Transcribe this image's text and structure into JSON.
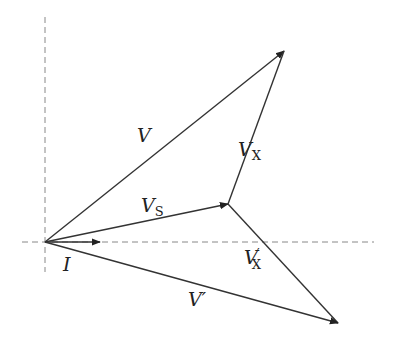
{
  "diagram": {
    "type": "phasor-diagram",
    "origin": [
      45,
      242
    ],
    "axes": {
      "horizontal": {
        "from": [
          22,
          242
        ],
        "to": [
          374,
          242
        ],
        "style": "dashed"
      },
      "vertical": {
        "from": [
          45,
          17
        ],
        "to": [
          45,
          272
        ],
        "style": "dashed"
      }
    },
    "vectors": [
      {
        "id": "I",
        "from": [
          45,
          242
        ],
        "to": [
          100,
          242
        ],
        "label": "I",
        "subscript": "",
        "prime": ""
      },
      {
        "id": "V",
        "from": [
          45,
          242
        ],
        "to": [
          284,
          51
        ],
        "label": "V",
        "subscript": "",
        "prime": ""
      },
      {
        "id": "VS",
        "from": [
          45,
          242
        ],
        "to": [
          228,
          204
        ],
        "label": "V",
        "subscript": "S",
        "prime": ""
      },
      {
        "id": "VX",
        "from": [
          228,
          204
        ],
        "to": [
          284,
          51
        ],
        "label": "V",
        "subscript": "X",
        "prime": ""
      },
      {
        "id": "VXp",
        "from": [
          228,
          204
        ],
        "to": [
          338,
          323
        ],
        "label": "V",
        "subscript": "X",
        "prime": "′"
      },
      {
        "id": "Vp",
        "from": [
          45,
          242
        ],
        "to": [
          338,
          323
        ],
        "label": "V",
        "subscript": "",
        "prime": "′"
      }
    ],
    "labels": {
      "V": {
        "text": "V",
        "x": 137,
        "y": 142
      },
      "VX": {
        "main": "V",
        "sub": "X",
        "x": 238,
        "y": 156
      },
      "VS": {
        "main": "V",
        "sub": "S",
        "x": 141,
        "y": 212
      },
      "I": {
        "text": "I",
        "x": 63,
        "y": 271
      },
      "VXp": {
        "main": "V",
        "prime": "′",
        "sub": "X",
        "x": 244,
        "y": 264
      },
      "Vp": {
        "main": "V",
        "prime": "′",
        "x": 188,
        "y": 306
      }
    }
  }
}
